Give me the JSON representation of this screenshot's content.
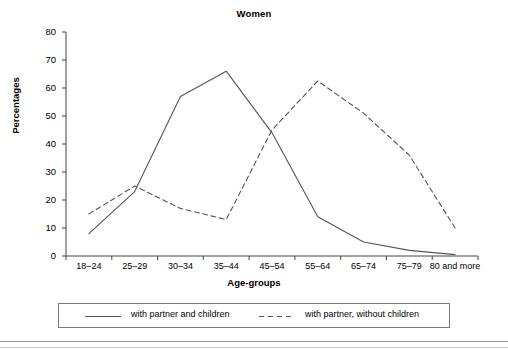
{
  "chart_data": {
    "type": "line",
    "title": "Women",
    "xlabel": "Age-groups",
    "ylabel": "Percentages",
    "categories": [
      "18–24",
      "25–29",
      "30–34",
      "35–44",
      "45–54",
      "55–64",
      "65–74",
      "75–79",
      "80 and more"
    ],
    "ylim": [
      0,
      80
    ],
    "yticks": [
      0,
      10,
      20,
      30,
      40,
      50,
      60,
      70,
      80
    ],
    "ytick_labels": [
      "0",
      "10",
      "20",
      "30",
      "40",
      "50",
      "60",
      "70",
      "80"
    ],
    "grid": false,
    "legend_position": "bottom",
    "series": [
      {
        "name": "with partner and children",
        "style": "solid",
        "color": "#555555",
        "values": [
          8,
          23,
          57,
          66,
          44,
          14,
          5,
          2,
          0.5
        ]
      },
      {
        "name": "with partner, without children",
        "style": "dashed",
        "color": "#555555",
        "values": [
          15,
          25,
          17,
          13,
          45,
          62.5,
          51,
          36,
          10
        ]
      }
    ]
  },
  "axis": {
    "tick_color": "#444444",
    "axis_color": "#444444"
  }
}
